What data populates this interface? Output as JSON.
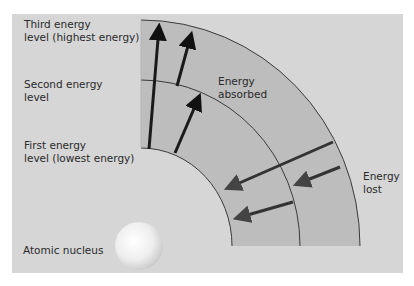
{
  "diagram": {
    "colors": {
      "panel": "#d6d6d6",
      "band": "#bdbdbd",
      "arc_line": "#3a3a3a",
      "arrow_absorbed": "#1a1a1a",
      "arrow_lost": "#333333",
      "nucleus": "#f4f4f4"
    },
    "labels": {
      "third_level": "Third energy\nlevel (highest energy)",
      "second_level": "Second energy\nlevel",
      "first_level": "First energy\nlevel (lowest energy)",
      "nucleus": "Atomic nucleus",
      "absorbed": "Energy\nabsorbed",
      "lost": "Energy\nlost"
    },
    "energy_levels": [
      {
        "name": "first",
        "rank": 1
      },
      {
        "name": "second",
        "rank": 2
      },
      {
        "name": "third",
        "rank": 3
      }
    ],
    "transitions_absorbed": [
      {
        "from": 1,
        "to": 3
      },
      {
        "from": 2,
        "to": 3
      },
      {
        "from": 1,
        "to": 2
      }
    ],
    "transitions_lost": [
      {
        "from": 3,
        "to": 1
      },
      {
        "from": 3,
        "to": 2
      },
      {
        "from": 2,
        "to": 1
      }
    ]
  }
}
